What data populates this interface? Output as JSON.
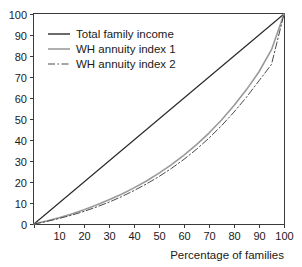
{
  "chart_data": {
    "type": "line",
    "title": "",
    "xlabel": "Percentage of families",
    "ylabel": "",
    "xlim": [
      0,
      100
    ],
    "ylim": [
      0,
      100
    ],
    "grid": false,
    "legend_position": "top-left",
    "x_ticks": [
      0,
      10,
      20,
      30,
      40,
      50,
      60,
      70,
      80,
      90,
      100
    ],
    "x_tick_labels": [
      "",
      "10",
      "20",
      "30",
      "40",
      "50",
      "60",
      "70",
      "80",
      "90",
      "100"
    ],
    "y_ticks": [
      0,
      10,
      20,
      30,
      40,
      50,
      60,
      70,
      80,
      90,
      100
    ],
    "y_tick_labels": [
      "0",
      "10",
      "20",
      "30",
      "40",
      "50",
      "60",
      "70",
      "80",
      "90",
      "100"
    ],
    "x": [
      0,
      5,
      10,
      15,
      20,
      25,
      30,
      35,
      40,
      45,
      50,
      55,
      60,
      65,
      70,
      75,
      80,
      85,
      90,
      95,
      100
    ],
    "series": [
      {
        "name": "Total family income",
        "style": "solid",
        "color": "#2b2b2b",
        "width": 1.2,
        "values": [
          0,
          5,
          10,
          15,
          20,
          25,
          30,
          35,
          40,
          45,
          50,
          55,
          60,
          65,
          70,
          75,
          80,
          85,
          90,
          95,
          100
        ]
      },
      {
        "name": "WH annuity index 1",
        "style": "solid",
        "color": "#9a9a9a",
        "width": 1.6,
        "values": [
          0,
          1.4,
          3.0,
          4.8,
          6.8,
          9.0,
          11.5,
          14.2,
          17.2,
          20.5,
          24.2,
          28.3,
          32.8,
          37.8,
          43.3,
          49.5,
          56.4,
          64.0,
          72.5,
          83.0,
          100
        ]
      },
      {
        "name": "WH annuity index 2",
        "style": "dashdot",
        "color": "#4a4a4a",
        "width": 1.0,
        "values": [
          0,
          1.2,
          2.6,
          4.2,
          6.0,
          8.1,
          10.4,
          13.0,
          15.9,
          19.1,
          22.6,
          26.5,
          30.8,
          35.6,
          40.9,
          46.8,
          53.3,
          60.4,
          68.2,
          76.0,
          100
        ]
      }
    ],
    "legend": [
      {
        "label": "Total family income",
        "style": "solid",
        "color": "#2b2b2b",
        "width": 1.4
      },
      {
        "label": "WH annuity index 1",
        "style": "solid",
        "color": "#a6a6a6",
        "width": 1.8
      },
      {
        "label": "WH annuity index 2",
        "style": "dashdot",
        "color": "#4a4a4a",
        "width": 1.1
      }
    ]
  }
}
